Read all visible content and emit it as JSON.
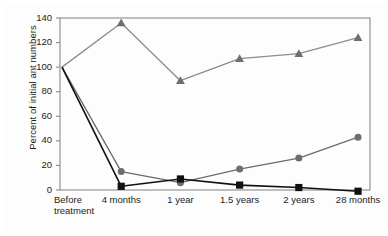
{
  "figure": {
    "background_color": "#fdfdfd",
    "frame_color": "#8a8a8a"
  },
  "axes": {
    "y_title": "Percent of initial ant numbers",
    "x_title": "",
    "y_ticks": [
      "0",
      "20",
      "40",
      "60",
      "80",
      "100",
      "120",
      "140"
    ],
    "x_ticks": [
      "Before treatment",
      "4 months",
      "1 year",
      "1.5 years",
      "2 years",
      "28 months"
    ],
    "x_tick_line1": [
      "Before",
      "4 months",
      "1 year",
      "1.5 years",
      "2 years",
      "28 months"
    ],
    "x_tick_line2": [
      "treatment",
      "",
      "",
      "",
      "",
      ""
    ]
  },
  "chart_data": {
    "type": "line",
    "title": "",
    "xlabel": "",
    "ylabel": "Percent of initial ant numbers",
    "categories": [
      "Before treatment",
      "4 months",
      "1 year",
      "1.5 years",
      "2 years",
      "28 months"
    ],
    "ylim": [
      0,
      140
    ],
    "yticks": [
      0,
      20,
      40,
      60,
      80,
      100,
      120,
      140
    ],
    "grid": false,
    "legend": "none",
    "series": [
      {
        "name": "triangle-series",
        "marker": "triangle",
        "color": "#6e6e6e",
        "line_color": "#8c8c8c",
        "values": [
          100,
          136,
          89,
          107,
          111,
          124
        ]
      },
      {
        "name": "circle-series",
        "marker": "circle",
        "color": "#6e6e6e",
        "line_color": "#6b6b6b",
        "values": [
          100,
          15,
          6,
          17,
          26,
          43
        ]
      },
      {
        "name": "square-series",
        "marker": "square",
        "color": "#111111",
        "line_color": "#111111",
        "values": [
          100,
          3,
          9,
          4,
          2,
          -1
        ]
      }
    ]
  }
}
